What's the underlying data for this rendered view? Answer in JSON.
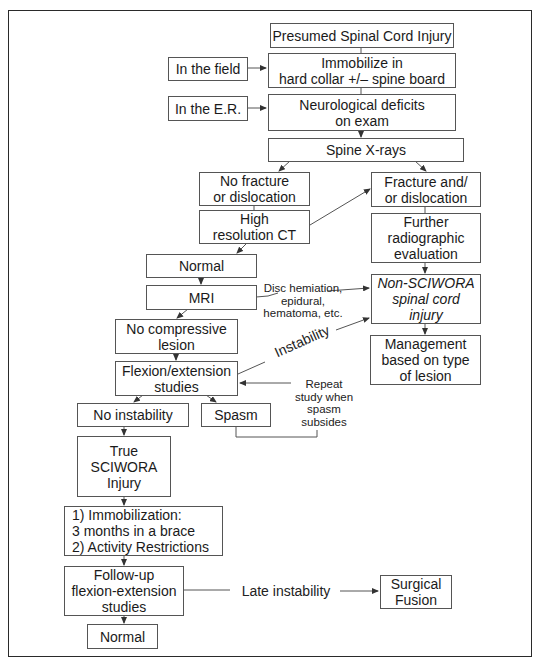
{
  "diagram": {
    "type": "flowchart",
    "title": "Presumed Spinal Cord Injury",
    "nodes": {
      "presumed_sci": "Presumed Spinal Cord Injury",
      "immobilize": "Immobilize in\nhard collar +/– spine board",
      "in_field": "In the field",
      "neuro_deficits": "Neurological deficits\non exam",
      "in_er": "In the E.R.",
      "spine_xrays": "Spine X-rays",
      "no_fracture": "No fracture\nor dislocation",
      "high_res_ct": "High\nresolution CT",
      "fracture": "Fracture and/\nor dislocation",
      "further_radiographic": "Further\nradiographic\nevaluation",
      "normal_1": "Normal",
      "mri": "MRI",
      "non_sciwora": "Non-SCIWORA\nspinal cord\ninjury",
      "management": "Management\nbased on type\nof lesion",
      "no_compressive": "No compressive\nlesion",
      "flex_ext": "Flexion/extension\nstudies",
      "no_instability": "No instability",
      "spasm": "Spasm",
      "true_sciwora": "True\nSCIWORA\nInjury",
      "immobilization_plan": "1) Immobilization:\n    3 months in a brace\n2) Activity Restrictions",
      "follow_up": "Follow-up\nflexion-extension\nstudies",
      "normal_2": "Normal",
      "surgical_fusion": "Surgical\nFusion"
    },
    "edge_labels": {
      "disc_herniation": "Disc hemiation,\nepidural,\nhematoma, etc.",
      "instability": "Instability",
      "repeat_study": "Repeat\nstudy when\nspasm\nsubsides",
      "late_instability": "Late instability"
    },
    "edges": [
      [
        "presumed_sci",
        "immobilize"
      ],
      [
        "in_field",
        "immobilize"
      ],
      [
        "immobilize",
        "neuro_deficits"
      ],
      [
        "in_er",
        "neuro_deficits"
      ],
      [
        "neuro_deficits",
        "spine_xrays"
      ],
      [
        "spine_xrays",
        "no_fracture"
      ],
      [
        "spine_xrays",
        "fracture"
      ],
      [
        "no_fracture",
        "high_res_ct"
      ],
      [
        "high_res_ct",
        "fracture"
      ],
      [
        "high_res_ct",
        "normal_1"
      ],
      [
        "fracture",
        "further_radiographic"
      ],
      [
        "further_radiographic",
        "non_sciwora"
      ],
      [
        "normal_1",
        "mri"
      ],
      [
        "mri",
        "non_sciwora",
        "Disc hemiation, epidural, hematoma, etc."
      ],
      [
        "mri",
        "no_compressive"
      ],
      [
        "non_sciwora",
        "management"
      ],
      [
        "no_compressive",
        "flex_ext"
      ],
      [
        "flex_ext",
        "non_sciwora",
        "Instability"
      ],
      [
        "flex_ext",
        "no_instability"
      ],
      [
        "flex_ext",
        "spasm"
      ],
      [
        "spasm",
        "flex_ext",
        "Repeat study when spasm subsides"
      ],
      [
        "no_instability",
        "true_sciwora"
      ],
      [
        "true_sciwora",
        "immobilization_plan"
      ],
      [
        "immobilization_plan",
        "follow_up"
      ],
      [
        "follow_up",
        "normal_2"
      ],
      [
        "follow_up",
        "surgical_fusion",
        "Late instability"
      ]
    ],
    "colors": {
      "stroke": "#555555",
      "text": "#1a1a1a",
      "background": "#ffffff"
    }
  }
}
